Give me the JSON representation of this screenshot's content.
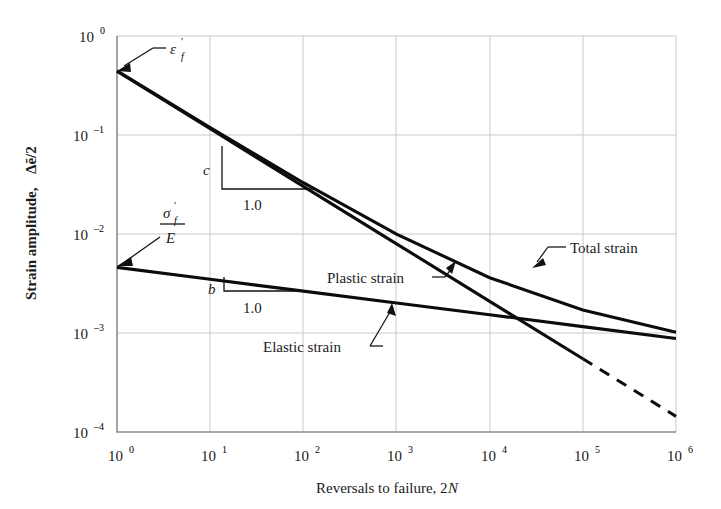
{
  "chart_data": {
    "type": "line",
    "title": "",
    "xlabel": "Reversals to failure, 2N",
    "ylabel": "Strain amplitude, Δẽ/2",
    "xscale": "log",
    "yscale": "log",
    "xlim": [
      1,
      1000000
    ],
    "ylim": [
      0.0001,
      1
    ],
    "grid": true,
    "legend_position": "inline-annotations",
    "x_tick_labels": [
      "10⁰",
      "10¹",
      "10²",
      "10³",
      "10⁴",
      "10⁵",
      "10⁶"
    ],
    "x_tick_values": [
      1,
      10,
      100,
      1000,
      10000,
      100000,
      1000000
    ],
    "y_tick_labels": [
      "10⁰",
      "10⁻¹",
      "10⁻²",
      "10⁻³",
      "10⁻⁴"
    ],
    "y_tick_values": [
      1,
      0.1,
      0.01,
      0.001,
      0.0001
    ],
    "series": [
      {
        "name": "Plastic strain",
        "style": "solid",
        "x": [
          1,
          10,
          100,
          1000,
          10000,
          100000
        ],
        "y": [
          0.44,
          0.1155,
          0.0303,
          0.00796,
          0.00209,
          0.00055
        ]
      },
      {
        "name": "Plastic strain (extrapolated)",
        "style": "dashed",
        "x": [
          100000,
          1000000
        ],
        "y": [
          0.00055,
          0.000144
        ]
      },
      {
        "name": "Elastic strain",
        "style": "solid",
        "x": [
          1,
          10,
          100,
          1000,
          10000,
          100000,
          1000000
        ],
        "y": [
          0.0046,
          0.00349,
          0.00265,
          0.00201,
          0.00153,
          0.00116,
          0.00088
        ]
      },
      {
        "name": "Total strain",
        "style": "solid",
        "x": [
          1,
          10,
          100,
          1000,
          10000,
          100000,
          1000000
        ],
        "y": [
          0.4446,
          0.11899,
          0.03295,
          0.00997,
          0.00362,
          0.00171,
          0.00102
        ]
      }
    ],
    "annotations": [
      {
        "name": "epsilon-f-prime",
        "text": "ε′f",
        "x": 1,
        "y": 0.44,
        "note": "intercept of plastic strain line"
      },
      {
        "name": "sigma-f-prime-over-E",
        "text": "σ′f / E",
        "x": 1,
        "y": 0.0046,
        "note": "intercept of elastic strain line"
      },
      {
        "name": "slope-c",
        "text": "c",
        "base": "1.0",
        "note": "slope of plastic strain line"
      },
      {
        "name": "slope-b",
        "text": "b",
        "base": "1.0",
        "note": "slope of elastic strain line"
      },
      {
        "name": "plastic-strain-label",
        "text": "Plastic strain"
      },
      {
        "name": "elastic-strain-label",
        "text": "Elastic strain"
      },
      {
        "name": "total-strain-label",
        "text": "Total strain"
      }
    ]
  },
  "axes": {
    "x_title": "Reversals to failure, 2N",
    "x_title_plain": "Reversals to failure, 2",
    "x_title_italic": "N",
    "y_title_plain": "Strain amplitude,",
    "y_title_symbol": "Δẽ/2",
    "x_ticks": [
      {
        "mantissa": "10",
        "exponent": "0"
      },
      {
        "mantissa": "10",
        "exponent": "1"
      },
      {
        "mantissa": "10",
        "exponent": "2"
      },
      {
        "mantissa": "10",
        "exponent": "3"
      },
      {
        "mantissa": "10",
        "exponent": "4"
      },
      {
        "mantissa": "10",
        "exponent": "5"
      },
      {
        "mantissa": "10",
        "exponent": "6"
      }
    ],
    "y_ticks": [
      {
        "mantissa": "10",
        "exponent": "0"
      },
      {
        "mantissa": "10",
        "exponent": "–1"
      },
      {
        "mantissa": "10",
        "exponent": "–2"
      },
      {
        "mantissa": "10",
        "exponent": "–3"
      },
      {
        "mantissa": "10",
        "exponent": "–4"
      }
    ]
  },
  "labels": {
    "total_strain": "Total strain",
    "plastic_strain": "Plastic strain",
    "elastic_strain": "Elastic strain",
    "slope_c": "c",
    "slope_c_base": "1.0",
    "slope_b": "b",
    "slope_b_base": "1.0",
    "eps_symbol": "ε",
    "eps_prime": "′",
    "eps_sub": "f",
    "sigma_symbol": "σ",
    "sigma_prime": "′",
    "sigma_sub": "f",
    "modulus": "E"
  },
  "colors": {
    "curve": "#0c0c0c",
    "grid": "#c9c9c9",
    "axis": "#8d8d8d",
    "text": "#1b1b1b",
    "background": "#ffffff"
  }
}
